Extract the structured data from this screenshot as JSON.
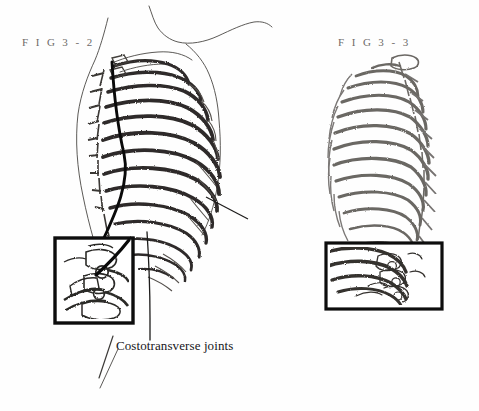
{
  "page": {
    "background_color": "#fefefe",
    "width": 479,
    "height": 411,
    "kind": "anatomy-textbook-figure-plate"
  },
  "figures": [
    {
      "id": "fig-3-2",
      "label": "F I G  3 - 2",
      "label_color": "#6d6a68",
      "subject": "thoracic cage in body outline, lateral-posterior view",
      "has_body_outline": true,
      "ink_color": "#35322f",
      "inset": {
        "label": "vertebra-costovertebral-detail-inset",
        "border_color": "#111111",
        "x": 55,
        "y": 238,
        "width": 78,
        "height": 85
      },
      "leader_lines": [
        "thick-black-pointer-to-inset",
        "thin-vertical-leader-to-caption",
        "short-rib-pointer"
      ]
    },
    {
      "id": "fig-3-3",
      "label": "F I G  3 - 3",
      "label_color": "#6d6a68",
      "subject": "thoracic cage skeleton, lateral view",
      "has_body_outline": false,
      "ink_color": "#6f6c69",
      "inset": {
        "label": "lower-rib-costotransverse-detail-inset",
        "border_color": "#111111",
        "x": 326,
        "y": 243,
        "width": 116,
        "height": 66
      },
      "leader_lines": []
    }
  ],
  "annotations": [
    {
      "id": "costotransverse-joints",
      "text": "Costotransverse joints",
      "color": "#16151a",
      "x": 116,
      "y": 338
    }
  ]
}
